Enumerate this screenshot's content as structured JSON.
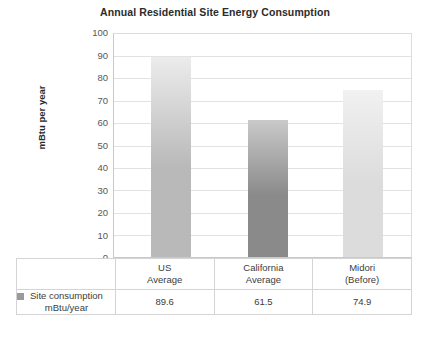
{
  "chart_data": {
    "type": "bar",
    "title": "Annual Residential Site Energy Consumption",
    "xlabel": "",
    "ylabel": "mBtu per year",
    "ylim": [
      0,
      100
    ],
    "ytick_step": 10,
    "yticks": [
      "100",
      "90",
      "80",
      "70",
      "60",
      "50",
      "40",
      "30",
      "20",
      "10",
      "0"
    ],
    "grid": true,
    "legend_position": "table-row-left",
    "categories": [
      "US Average",
      "California Average",
      "Midori (Before)"
    ],
    "category_lines": [
      [
        "US",
        "Average"
      ],
      [
        "California",
        "Average"
      ],
      [
        "Midori",
        "(Before)"
      ]
    ],
    "series": [
      {
        "name": "Site consumption mBtu/year",
        "values": [
          89.6,
          61.5,
          74.9
        ],
        "value_labels": [
          "89.6",
          "61.5",
          "74.9"
        ]
      }
    ],
    "bar_colors_top": [
      "#ececec",
      "#c9c9c9",
      "#f1f1f1"
    ],
    "bar_colors_bottom": [
      "#b9b9b9",
      "#8a8a8a",
      "#dcdcdc"
    ]
  },
  "legend": {
    "marker_color": "#9a9a9a",
    "label_line1": "Site consumption",
    "label_line2": "mBtu/year"
  },
  "colors": {
    "gridline": "#e2e2e2",
    "axis": "#c9c9c9",
    "table_border": "#d4d4d4",
    "text": "#3c3c3c",
    "title_text": "#2b2b2b"
  }
}
